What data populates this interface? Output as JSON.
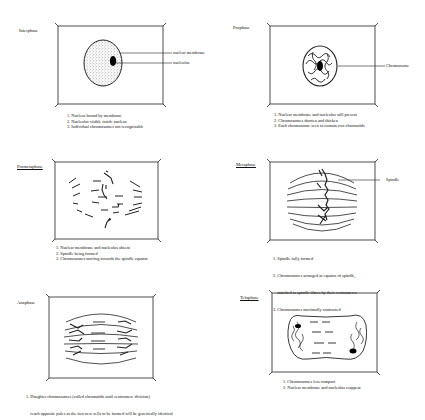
{
  "panels": [
    {
      "id": "interphase",
      "label": "Interphase",
      "callouts": [
        "nuclear membrane",
        "nucleolus"
      ],
      "notes": [
        "1. Nucleus bound by membrane",
        "2. Nucleolus visible inside nucleus",
        "3. Individual chromosomes not recognizable"
      ]
    },
    {
      "id": "prophase",
      "label": "Prophase",
      "callouts": [
        "Chromosome"
      ],
      "notes": [
        "1. Nuclear membrane and nucleolus still present",
        "2. Chromosomes shorten and thicken",
        "3. Each chromosome seen to contain two chromatids"
      ]
    },
    {
      "id": "prometaphase",
      "label": "Prometaphase",
      "callouts": [],
      "notes": [
        "1. Nuclear membrane and nucleolus absent",
        "2. Spindle being formed",
        "3. Chromosomes moving towards the spindle equator"
      ]
    },
    {
      "id": "metaphase",
      "label": "Metaphase",
      "callouts": [
        "Spindle"
      ],
      "notes": [
        "1. Spindle fully formed",
        "2. Chromosomes arranged at equator of spindle,",
        "    attached to spindle fibres by their centromeres",
        "3. Chromosomes maximally contracted"
      ]
    },
    {
      "id": "anaphase",
      "label": "Anaphase",
      "callouts": [],
      "notes": [
        "1. Daughter chromosomes (called chromatids until centromere division)",
        "    reach opposite poles as the two new cells to be formed will be genetically identical"
      ]
    },
    {
      "id": "telophase",
      "label": "Telophase",
      "callouts": [],
      "notes": [
        "1. Chromosomes less compact",
        "2. Nuclear membrane and nucleolus reappear"
      ]
    }
  ]
}
